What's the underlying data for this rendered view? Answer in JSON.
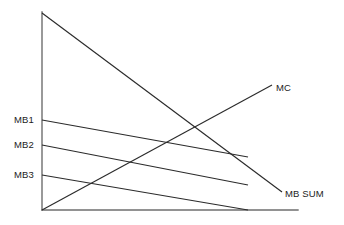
{
  "figure": {
    "kind": "economics-line-diagram",
    "background_color": "#ffffff",
    "axis_color": "#6e6e6e",
    "curve_color": "#2b2b2b"
  },
  "labels": {
    "mb1": "MB1",
    "mb2": "MB2",
    "mb3": "MB3",
    "mc": "MC",
    "mb_sum": "MB SUM"
  },
  "chart_data": {
    "type": "line",
    "title": "",
    "xlabel": "",
    "ylabel": "",
    "grid": false,
    "legend": "inline-end-labels",
    "axes": {
      "y_axis": {
        "x": 42,
        "y_top": 12,
        "y_bottom": 210
      },
      "x_axis": {
        "y": 210,
        "x_left": 42,
        "x_right": 298
      },
      "origin": {
        "x": 42,
        "y": 210
      }
    },
    "series": [
      {
        "name": "MB SUM",
        "description": "vertical summation of individual marginal benefit curves; steep downward slope from y-axis intercept to lower right",
        "label_position": "end-right",
        "points": [
          [
            42,
            13
          ],
          [
            282,
            192
          ]
        ]
      },
      {
        "name": "MC",
        "description": "marginal cost curve; upward sloping from the origin",
        "label_position": "end-right",
        "points": [
          [
            42,
            210
          ],
          [
            272,
            85
          ]
        ]
      },
      {
        "name": "MB1",
        "description": "individual marginal benefit curve 1; highest intercept, gentle downward slope",
        "label_position": "start-left",
        "points": [
          [
            42,
            120
          ],
          [
            248,
            157
          ]
        ]
      },
      {
        "name": "MB2",
        "description": "individual marginal benefit curve 2; middle intercept, gentle downward slope",
        "label_position": "start-left",
        "points": [
          [
            42,
            145
          ],
          [
            248,
            185
          ]
        ]
      },
      {
        "name": "MB3",
        "description": "individual marginal benefit curve 3; lowest intercept, meets the horizontal axis",
        "label_position": "start-left",
        "points": [
          [
            42,
            175
          ],
          [
            248,
            210
          ]
        ]
      }
    ]
  }
}
